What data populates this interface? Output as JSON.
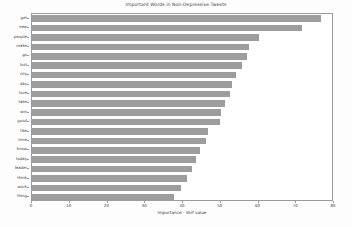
{
  "chart_data": {
    "type": "bar",
    "orientation": "horizontal",
    "title": "Important Words in Non-Depressive Tweets",
    "xlabel": "Importance - Shif value",
    "ylabel": "",
    "xlim": [
      0,
      80
    ],
    "ylim": null,
    "grid": false,
    "legend": null,
    "bar_color": "#9d9d9d",
    "background_color": "#ffffff",
    "xticks": [
      0,
      10,
      20,
      30,
      40,
      50,
      60,
      70,
      80
    ],
    "categories": [
      "get",
      "new",
      "people",
      "make",
      "go",
      "lost",
      "city",
      "day",
      "love",
      "take",
      "win",
      "good",
      "like",
      "time",
      "know",
      "today",
      "leader",
      "think",
      "work",
      "thing"
    ],
    "values": [
      76.5,
      71.5,
      60.0,
      57.5,
      57.0,
      55.5,
      54.0,
      53.0,
      52.5,
      51.0,
      50.0,
      49.8,
      46.5,
      46.0,
      44.5,
      43.5,
      42.5,
      41.0,
      39.5,
      37.5
    ]
  }
}
